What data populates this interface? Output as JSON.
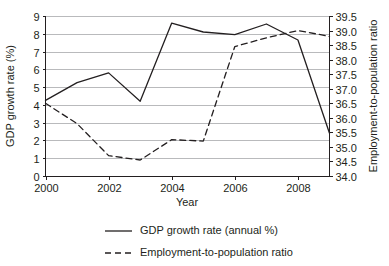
{
  "chart_data": {
    "type": "line",
    "title": "",
    "xlabel": "Year",
    "ylabel": "GDP growth rate (%)",
    "y2label": "Employment-to-population ratio",
    "x": [
      2000,
      2001,
      2002,
      2003,
      2004,
      2005,
      2006,
      2007,
      2008,
      2009
    ],
    "xlim": [
      2000,
      2009
    ],
    "xtick_labels": [
      "2000",
      "2002",
      "2004",
      "2006",
      "2008"
    ],
    "xtick_values": [
      2000,
      2002,
      2004,
      2006,
      2008
    ],
    "ylim": [
      0,
      9
    ],
    "ytick_labels": [
      "0",
      "1",
      "2",
      "3",
      "4",
      "5",
      "6",
      "7",
      "8",
      "9"
    ],
    "ytick_values": [
      0,
      1,
      2,
      3,
      4,
      5,
      6,
      7,
      8,
      9
    ],
    "y2lim": [
      34.0,
      39.5
    ],
    "y2tick_labels": [
      "34.0",
      "34.5",
      "35.0",
      "35.5",
      "36.0",
      "36.5",
      "37.0",
      "37.5",
      "38.0",
      "38.5",
      "39.0",
      "39.5"
    ],
    "y2tick_values": [
      34.0,
      34.5,
      35.0,
      35.5,
      36.0,
      36.5,
      37.0,
      37.5,
      38.0,
      38.5,
      39.0,
      39.5
    ],
    "grid": "horizontal",
    "legend_position": "bottom",
    "series": [
      {
        "name": "GDP growth rate (annual %)",
        "axis": "left",
        "style": "solid",
        "color": "#231f20",
        "values": [
          4.25,
          5.25,
          5.8,
          4.2,
          8.6,
          8.1,
          7.95,
          8.55,
          7.65,
          2.4
        ]
      },
      {
        "name": "Employment-to-population ratio",
        "axis": "right",
        "style": "dashed",
        "color": "#231f20",
        "values": [
          36.5,
          35.8,
          34.7,
          34.55,
          35.25,
          35.2,
          38.45,
          38.75,
          39.0,
          38.8
        ]
      }
    ]
  },
  "legend": {
    "items": [
      {
        "label": "GDP growth rate (annual %)",
        "style": "solid"
      },
      {
        "label": "Employment-to-population ratio",
        "style": "dashed"
      }
    ]
  },
  "colors": {
    "axis": "#231f20",
    "grid": "#b9babc",
    "background": "#ffffff"
  }
}
